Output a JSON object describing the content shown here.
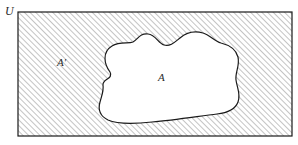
{
  "figure": {
    "name": "venn-diagram-complement",
    "labels": {
      "universe": "U",
      "complement_region": "A′",
      "subset_region": "A"
    },
    "colors": {
      "outline": "#1a1a1a",
      "hatch_line": "#8a8a8a",
      "background": "#ffffff",
      "fill_subset": "#ffffff",
      "label_text": "#2b2b2b"
    },
    "geometry": {
      "rectangle": {
        "x": 18,
        "y": 12,
        "width": 274,
        "height": 124
      },
      "hatch_angle_deg": 45,
      "hatch_spacing_px": 4
    },
    "label_positions": {
      "universe": {
        "x": 5,
        "y": 13
      },
      "complement_region": {
        "x": 57,
        "y": 66
      },
      "subset_region": {
        "x": 158,
        "y": 81
      }
    }
  }
}
